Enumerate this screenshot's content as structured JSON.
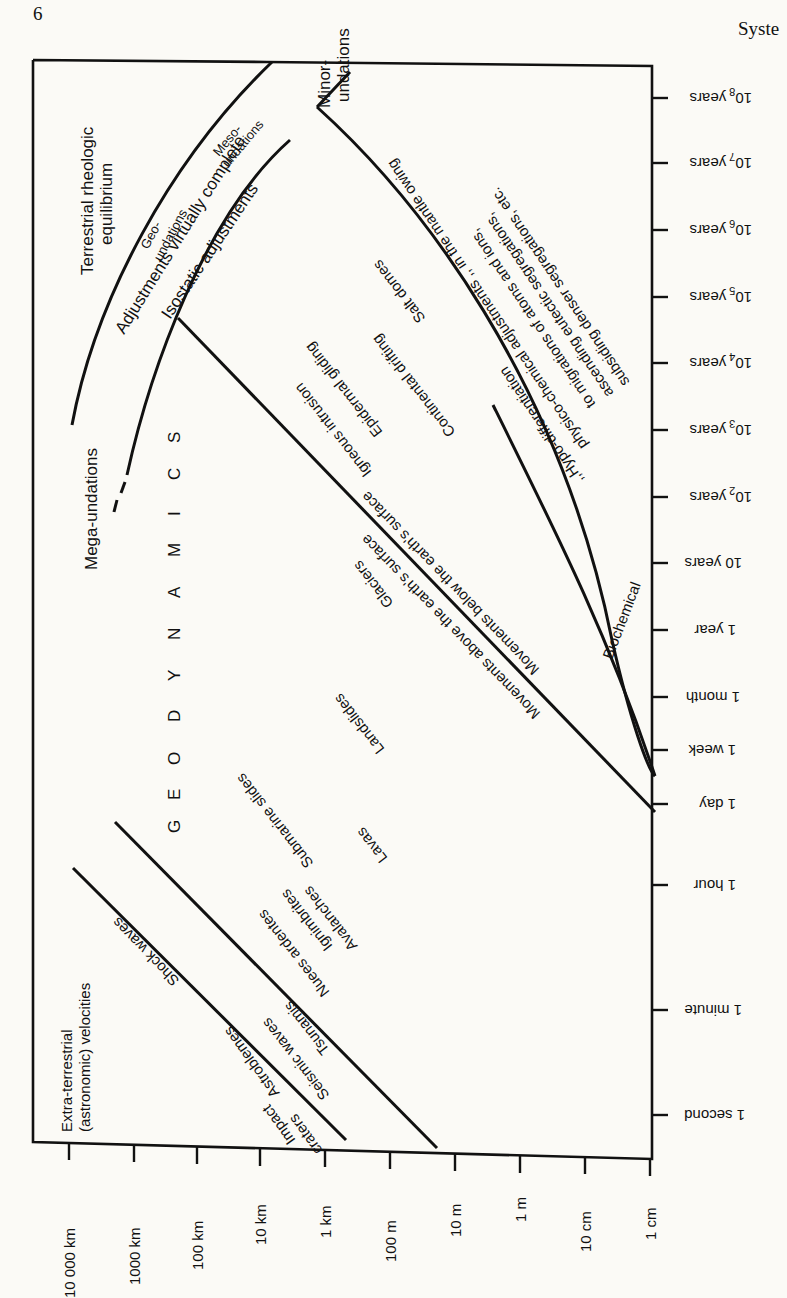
{
  "page": {
    "number": "6",
    "running_head": "Syste"
  },
  "figure": {
    "orientation": "rotated 90° counterclockwise on page",
    "title_letters": [
      "G",
      "E",
      "O",
      "D",
      "Y",
      "N",
      "A",
      "M",
      "I",
      "C",
      "S"
    ],
    "x_axis": {
      "description": "spatial dimension",
      "ticks": [
        "10 000 km",
        "1000 km",
        "100 km",
        "10 km",
        "1 km",
        "100 m",
        "10 m",
        "1 m",
        "10 cm",
        "1 cm"
      ]
    },
    "y_axis": {
      "description": "time scale",
      "ticks": [
        "10",
        "10",
        "10",
        "10",
        "10",
        "10",
        "10",
        "10 years",
        "1 year",
        "1 month",
        "1 week",
        "1 day",
        "1 hour",
        "1 minute",
        "1 second"
      ],
      "tick_labels": [
        {
          "base": "10",
          "exp": "8",
          "unit": "years"
        },
        {
          "base": "10",
          "exp": "7",
          "unit": "years"
        },
        {
          "base": "10",
          "exp": "6",
          "unit": "years"
        },
        {
          "base": "10",
          "exp": "5",
          "unit": "years"
        },
        {
          "base": "10",
          "exp": "4",
          "unit": "years"
        },
        {
          "base": "10",
          "exp": "3",
          "unit": "years"
        },
        {
          "base": "10",
          "exp": "2",
          "unit": "years"
        },
        {
          "base": "",
          "exp": "",
          "unit": "10 years"
        },
        {
          "base": "",
          "exp": "",
          "unit": "1 year"
        },
        {
          "base": "",
          "exp": "",
          "unit": "1 month"
        },
        {
          "base": "",
          "exp": "",
          "unit": "1 week"
        },
        {
          "base": "",
          "exp": "",
          "unit": "1 day"
        },
        {
          "base": "",
          "exp": "",
          "unit": "1 hour"
        },
        {
          "base": "",
          "exp": "",
          "unit": "1 minute"
        },
        {
          "base": "",
          "exp": "",
          "unit": "1 second"
        }
      ]
    },
    "labels": {
      "terrestrial_rheologic_1": "Terrestrial rheologic",
      "terrestrial_rheologic_2": "equilibrium",
      "adjustments_complete": "Adjustments virtually complete",
      "mega_undulations": "Mega-undations",
      "geo_undations_1": "Geo-",
      "geo_undations_2": "undations",
      "meso_undations_1": "Meso-",
      "meso_undations_2": "undations",
      "minor_undations_1": "Minor-",
      "minor_undations_2": "undations",
      "isostatic_adjustments": "Isostatic adjustments",
      "hypo_1": "subsiding denser segregations, etc.",
      "hypo_2": "ascending eutectic segregations,",
      "hypo_3": "to migrations of atoms and ions,",
      "hypo_4": "physico-chemical adjustments ,, in the mantle owing",
      "hypo_5": ",,Hypo-differentiation",
      "salt_domes": "Salt domes",
      "continental_drifting": "Continental drifting",
      "epidermal_gliding": "Epidermal gliding",
      "igneous_intrusion": "Igneous intrusion",
      "movements_below": "Movements below the earth's surface",
      "movements_above": "Movements above the earth's surface",
      "glaciers": "Glaciers",
      "biochemical_1": "Biochemical",
      "biochemical_2": "accretions",
      "landslides": "Landslides",
      "lavas": "Lavas",
      "submarine_slides": "Submarine slides",
      "avalanches": "Avalanches",
      "ignimbrites": "Ignimbrites",
      "nuees_ardentes": "Nuees ardentes",
      "tsunamis": "Tsunamis",
      "seismic_waves": "Seismic waves",
      "shock_waves": "Shock waves",
      "astroblemes": "Astroblemes",
      "impact_craters_1": "Impact",
      "impact_craters_2": "craters",
      "extra_terrestrial_1": "Extra-terrestrial",
      "extra_terrestrial_2": "(astronomic) velocities"
    }
  }
}
